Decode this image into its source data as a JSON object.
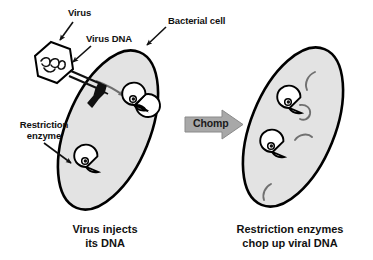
{
  "figure": {
    "title": "Restriction enzymes chop up viral DNA",
    "width": 373,
    "height": 260,
    "background": "#ffffff"
  },
  "colors": {
    "cell_fill": "#e3e3e3",
    "cell_stroke": "#000000",
    "arrow_fill": "#a8a8a8",
    "arrow_stroke": "#7a7a7a",
    "injection_arrow": "#6e6e6e",
    "dna_fragment": "#707070",
    "text": "#111111",
    "virus_fill": "#ffffff"
  },
  "labels": {
    "virus": "Virus",
    "virus_dna": "Virus DNA",
    "bacterial_cell": "Bacterial cell",
    "restriction_enzyme_line1": "Restriction",
    "restriction_enzyme_line2": "enzyme",
    "chomp": "Chomp"
  },
  "captions": {
    "left_line1": "Virus injects",
    "left_line2": "its DNA",
    "right_line1": "Restriction enzymes",
    "right_line2": "chop up viral DNA"
  },
  "diagram_data": {
    "type": "diagram",
    "subject": "Bacterial restriction enzyme defense against bacteriophage",
    "panels": [
      {
        "id": "left-panel",
        "caption": "Virus injects its DNA",
        "cell": {
          "enzymes": 2,
          "dna_fragments": 0,
          "intact_viral_dna": 1
        },
        "virus_attached": true
      },
      {
        "id": "right-panel",
        "caption": "Restriction enzymes chop up viral DNA",
        "cell": {
          "enzymes": 2,
          "dna_fragments": 4,
          "intact_viral_dna": 0
        },
        "virus_attached": false
      }
    ],
    "transition_label": "Chomp"
  }
}
